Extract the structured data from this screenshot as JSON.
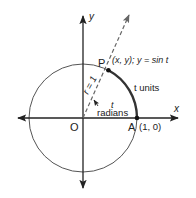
{
  "diagram": {
    "type": "unit-circle",
    "colors": {
      "stroke": "#222222",
      "circle": "#555555",
      "arc": "#333333",
      "background": "#ffffff"
    },
    "origin_px": [
      83,
      118
    ],
    "radius_px": 54,
    "angle_deg": 62,
    "labels": {
      "y_axis": "y",
      "x_axis": "x",
      "origin": "O",
      "point_a": "A",
      "point_a_coords": "(1, 0)",
      "point_p": "P",
      "point_p_desc": "(x, y); y = sin t",
      "radius": "r = 1",
      "arc_length": "t units",
      "angle_t": "t",
      "angle_unit": "radians"
    }
  }
}
